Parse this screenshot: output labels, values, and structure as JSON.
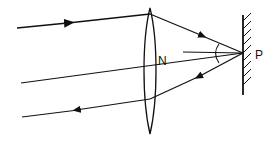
{
  "diagram": {
    "labels": {
      "lens_center": "N",
      "mirror_point": "P"
    },
    "elements": {
      "lens": "convex-lens",
      "mirror": "plane-mirror",
      "rays": [
        "incident-ray-top",
        "principal-axis-ray",
        "reflected-ray-bottom"
      ],
      "normal": "normal-at-P",
      "angle_arc": "angle-of-incidence-reflection"
    },
    "colors": {
      "stroke": "#111111",
      "background": "#ffffff"
    }
  }
}
